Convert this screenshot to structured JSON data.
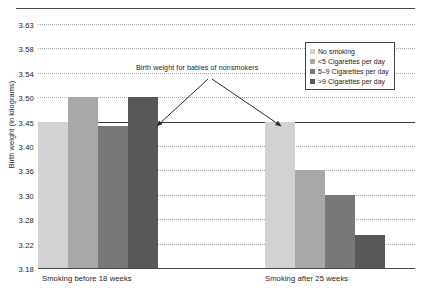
{
  "chart_data": {
    "type": "bar",
    "title": "",
    "xlabel": "",
    "ylabel": "Birth weight (in kilograms)",
    "categories": [
      "Smoking before 18 weeks",
      "Smoking after 25 weeks"
    ],
    "ytick_labels": [
      "3.63",
      "3.58",
      "3.54",
      "3.50",
      "3.45",
      "3.40",
      "3.36",
      "3.30",
      "3.28",
      "3.22",
      "3.18"
    ],
    "ylim": [
      3.18,
      3.63
    ],
    "grid": true,
    "grid_style": "dotted horizontal",
    "reference_line": {
      "value": "3.45",
      "label": "Birth weight for babies of nonsmokers",
      "style": "solid"
    },
    "legend_position": "top-right",
    "series": [
      {
        "name": "No smoking",
        "color": "#d2d2d2",
        "values": [
          3.45,
          3.45
        ]
      },
      {
        "name": "<5 Cigarettes per day",
        "color": "#a8a8a8",
        "values": [
          3.5,
          3.36
        ]
      },
      {
        "name": "5–9 Cigarettes per day",
        "color": "#787878",
        "values": [
          3.44,
          3.3
        ]
      },
      {
        "name": ">9 Cigarettes per day",
        "color": "#585858",
        "values": [
          3.5,
          3.24
        ]
      }
    ]
  },
  "legend": {
    "entries": [
      {
        "label": "No smoking"
      },
      {
        "label": "<5 Cigarettes per day"
      },
      {
        "label": "5–9 Cigarettes per day"
      },
      {
        "label": ">9 Cigarettes per day"
      }
    ]
  },
  "annotation": {
    "text": "Birth weight for babies of nonsmokers"
  },
  "axes": {
    "y_title": "Birth weight (in kilograms)",
    "x_group_1": "Smoking before 18 weeks",
    "x_group_2": "Smoking after 25 weeks"
  }
}
